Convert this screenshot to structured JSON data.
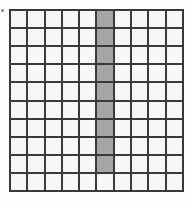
{
  "grid": {
    "rows": 10,
    "cols": 10,
    "colors": {
      "line": "#3a3a3a",
      "cell": "#f7f7f7",
      "shaded": "#a6a6a6"
    },
    "shaded_cells": [
      [
        0,
        5
      ],
      [
        1,
        5
      ],
      [
        2,
        5
      ],
      [
        3,
        5
      ],
      [
        4,
        5
      ],
      [
        5,
        5
      ],
      [
        6,
        5
      ],
      [
        7,
        5
      ],
      [
        8,
        5
      ]
    ],
    "shaded_count": 9,
    "total_cells": 100
  }
}
